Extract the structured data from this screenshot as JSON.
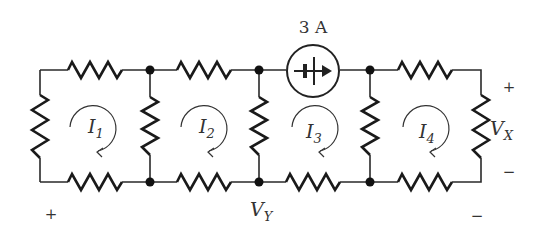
{
  "diagram": {
    "type": "circuit",
    "source": {
      "label": "3 A",
      "kind": "current-source",
      "direction": "right"
    },
    "meshes": [
      {
        "id": "I1",
        "letter": "I",
        "sub": "1",
        "direction": "clockwise"
      },
      {
        "id": "I2",
        "letter": "I",
        "sub": "2",
        "direction": "clockwise"
      },
      {
        "id": "I3",
        "letter": "I",
        "sub": "3",
        "direction": "clockwise"
      },
      {
        "id": "I4",
        "letter": "I",
        "sub": "4",
        "direction": "clockwise"
      }
    ],
    "voltages": {
      "vx": {
        "letter": "V",
        "sub": "X",
        "plus": "+",
        "minus": "−"
      },
      "vy": {
        "letter": "V",
        "sub": "Y",
        "plus": "+",
        "minus": "−"
      }
    },
    "resistor_count": 12,
    "node_count": 6
  }
}
